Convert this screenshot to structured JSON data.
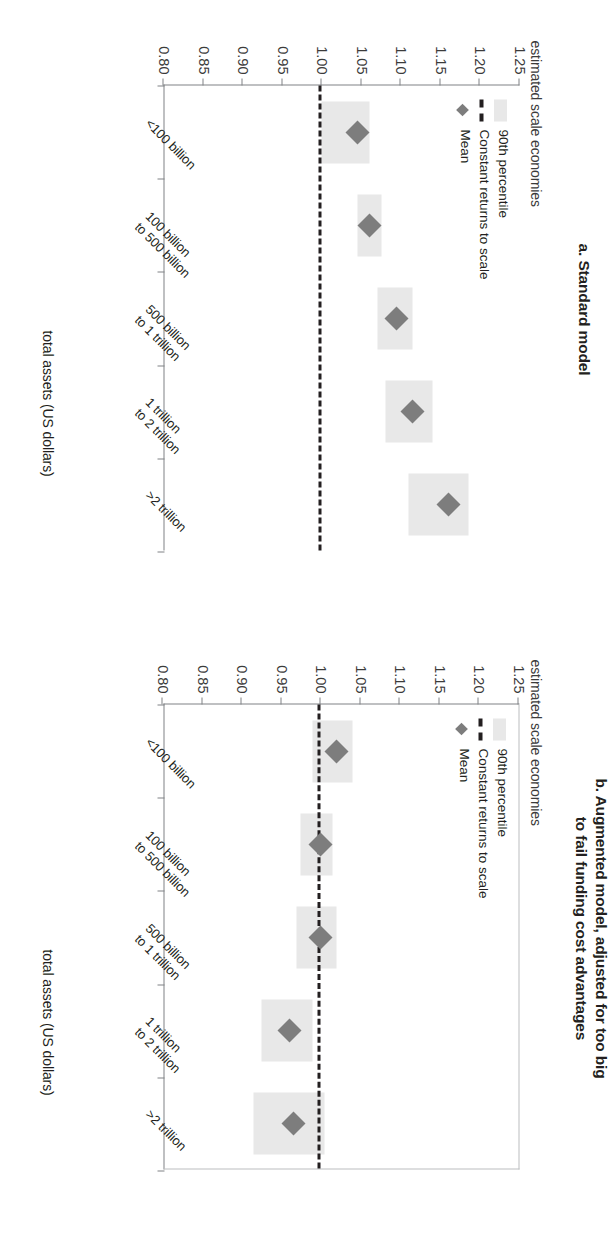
{
  "figure": {
    "axis": {
      "value_ticks": [
        "1.25",
        "1.20",
        "1.15",
        "1.10",
        "1.05",
        "1.00",
        "0.95",
        "0.90",
        "0.85",
        "0.80"
      ],
      "value_label": "estimated scale economies",
      "category_label": "total assets (US dollars)",
      "categories": [
        "<100 billion",
        "100 billion\nto 500 billion",
        "500 billion\nto 1 trillion",
        "1 trillion\nto 2 trillion",
        ">2 trillion"
      ]
    },
    "legend": {
      "band": "90th percentile",
      "line": "Constant returns to scale",
      "mean": "Mean"
    },
    "colors": {
      "band": "#e8e8e8",
      "mean": "#7d7d7d",
      "crs_line": "#231f20",
      "axis": "#808285"
    }
  },
  "chart_data": [
    {
      "type": "scatter",
      "panel": "a",
      "title": "a. Standard model",
      "ylabel": "estimated scale economies",
      "xlabel": "total assets (US dollars)",
      "ylim": [
        0.8,
        1.25
      ],
      "grid": false,
      "legend_position": "top-left inside plot",
      "categories": [
        "<100 billion",
        "100 billion to 500 billion",
        "500 billion to 1 trillion",
        "1 trillion to 2 trillion",
        ">2 trillion"
      ],
      "reference_line": {
        "label": "Constant returns to scale",
        "value": 1.0
      },
      "series": [
        {
          "name": "Mean",
          "values": [
            1.045,
            1.06,
            1.095,
            1.115,
            1.16
          ]
        },
        {
          "name": "90th percentile band low",
          "values": [
            1.0,
            1.045,
            1.07,
            1.08,
            1.11
          ]
        },
        {
          "name": "90th percentile band high",
          "values": [
            1.06,
            1.075,
            1.115,
            1.14,
            1.185
          ]
        }
      ]
    },
    {
      "type": "scatter",
      "panel": "b",
      "title": "b. Augmented model, adjusted for too big\nto fail funding cost advantages",
      "ylabel": "estimated scale economies",
      "xlabel": "total assets (US dollars)",
      "ylim": [
        0.8,
        1.25
      ],
      "grid": false,
      "legend_position": "top-left inside plot",
      "categories": [
        "<100 billion",
        "100 billion to 500 billion",
        "500 billion to 1 trillion",
        "1 trillion to 2 trillion",
        ">2 trillion"
      ],
      "reference_line": {
        "label": "Constant returns to scale",
        "value": 1.0
      },
      "series": [
        {
          "name": "Mean",
          "values": [
            1.02,
            1.0,
            1.0,
            0.96,
            0.965
          ]
        },
        {
          "name": "90th percentile band low",
          "values": [
            0.99,
            0.975,
            0.97,
            0.925,
            0.915
          ]
        },
        {
          "name": "90th percentile band high",
          "values": [
            1.04,
            1.015,
            1.02,
            0.99,
            1.005
          ]
        }
      ]
    }
  ]
}
